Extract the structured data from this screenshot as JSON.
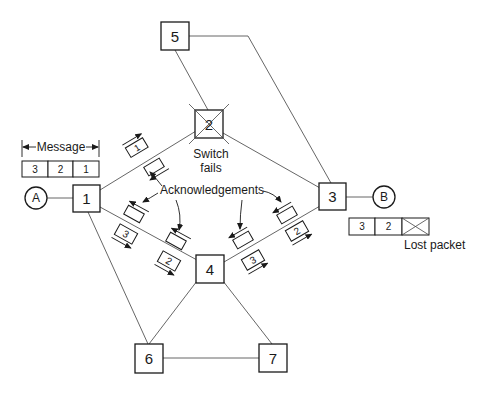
{
  "diagram": {
    "type": "packet-switching-network",
    "nodes": [
      {
        "id": "1",
        "label": "1"
      },
      {
        "id": "2",
        "label": "2",
        "failed": true
      },
      {
        "id": "3",
        "label": "3"
      },
      {
        "id": "4",
        "label": "4"
      },
      {
        "id": "5",
        "label": "5"
      },
      {
        "id": "6",
        "label": "6"
      },
      {
        "id": "7",
        "label": "7"
      }
    ],
    "endpoints": [
      {
        "id": "A",
        "label": "A"
      },
      {
        "id": "B",
        "label": "B"
      }
    ],
    "edges": [
      [
        "A",
        "1"
      ],
      [
        "1",
        "2"
      ],
      [
        "1",
        "4"
      ],
      [
        "1",
        "6"
      ],
      [
        "2",
        "5"
      ],
      [
        "2",
        "3"
      ],
      [
        "5",
        "3"
      ],
      [
        "4",
        "3"
      ],
      [
        "4",
        "6"
      ],
      [
        "4",
        "7"
      ],
      [
        "6",
        "7"
      ],
      [
        "3",
        "B"
      ]
    ],
    "message": {
      "label": "Message",
      "cells": [
        "3",
        "2",
        "1"
      ]
    },
    "switch_fail_label": [
      "Switch",
      "fails"
    ],
    "acknowledgements_label": "Acknowledgements",
    "packets_in_transit": {
      "link_1_2": [
        "1"
      ],
      "link_1_4": [
        "3",
        "2"
      ],
      "link_4_3": [
        "3",
        "2"
      ]
    },
    "received": {
      "cells": [
        "3",
        "2",
        "X"
      ],
      "lost_label": "Lost packet"
    }
  }
}
